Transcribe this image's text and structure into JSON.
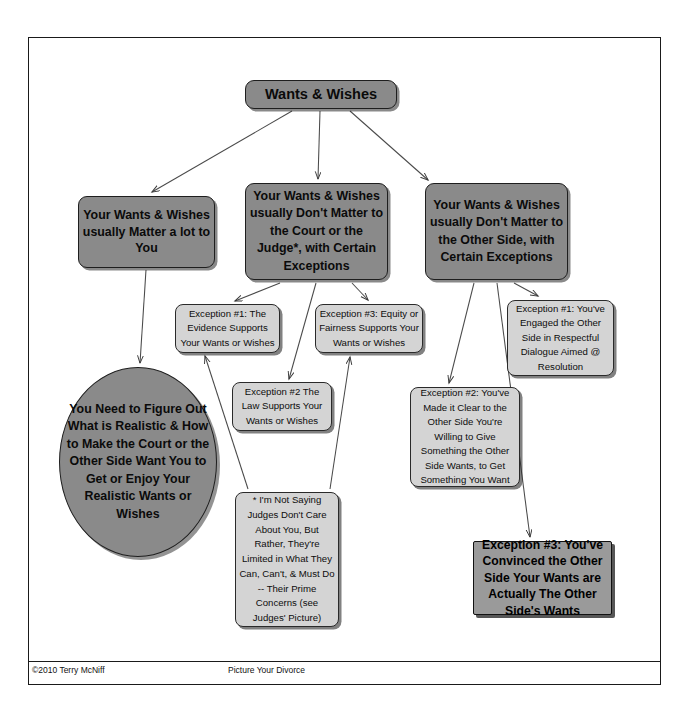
{
  "document": {
    "title": "Wants & Wishes",
    "footer_left": "©2010 Terry McNiff",
    "footer_center": "Picture Your Divorce"
  },
  "colors": {
    "node_dark": "#8a8a8a",
    "node_light": "#d4d4d4",
    "node_dark_square": "#9a9a9a",
    "outline": "#1e1e1e",
    "text": "#0a0a0a",
    "page_background": "#ffffff"
  },
  "nodes": {
    "root": "Wants & Wishes",
    "branch_you": "Your Wants & Wishes usually Matter a lot to You",
    "branch_court": "Your Wants & Wishes usually Don't Matter to the Court or the Judge*, with Certain Exceptions",
    "branch_other": "Your Wants & Wishes usually Don't Matter to the Other Side, with Certain Exceptions",
    "court_exception_1": "Exception #1: The Evidence Supports Your Wants or Wishes",
    "court_exception_2": "Exception #2  The Law Supports Your Wants or Wishes",
    "court_exception_3": "Exception #3: Equity or Fairness Supports Your Wants or Wishes",
    "outcome_oval": "You Need to Figure Out What is Realistic & How to Make the Court or the Other Side Want You to Get or Enjoy Your Realistic Wants or Wishes",
    "judges_footnote": "* I'm Not Saying Judges Don't Care About You, But Rather, They're Limited in What They Can, Can't, & Must Do -- Their Prime Concerns (see Judges' Picture)",
    "other_exception_1": "Exception #1: You've Engaged the Other Side in Respectful Dialogue Aimed @ Resolution",
    "other_exception_2": "Exception #2: You've Made it Clear to the Other Side You're Willing to Give Something the Other Side Wants, to Get Something You Want",
    "other_exception_3": "Exception #3: You've Convinced the Other Side Your Wants are Actually The Other Side's Wants"
  },
  "edges": [
    {
      "from": "root",
      "to": "branch_you"
    },
    {
      "from": "root",
      "to": "branch_court"
    },
    {
      "from": "root",
      "to": "branch_other"
    },
    {
      "from": "branch_you",
      "to": "outcome_oval"
    },
    {
      "from": "branch_court",
      "to": "court_exception_1"
    },
    {
      "from": "branch_court",
      "to": "court_exception_2"
    },
    {
      "from": "branch_court",
      "to": "court_exception_3"
    },
    {
      "from": "judges_footnote",
      "to": "court_exception_1"
    },
    {
      "from": "judges_footnote",
      "to": "court_exception_3"
    },
    {
      "from": "branch_other",
      "to": "other_exception_1"
    },
    {
      "from": "branch_other",
      "to": "other_exception_2"
    },
    {
      "from": "branch_other",
      "to": "other_exception_3"
    }
  ]
}
